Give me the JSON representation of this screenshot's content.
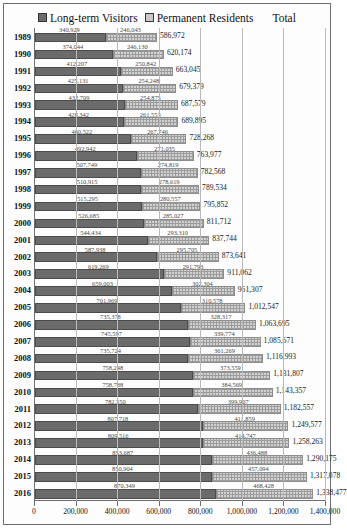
{
  "legend": {
    "series1_label": "Long-term Visitors",
    "series2_label": "Permanent Residents",
    "total_label": "Total",
    "series1_color": "#6b6b6b",
    "series2_color": "#d2d2d2"
  },
  "chart_data": {
    "type": "bar",
    "orientation": "horizontal",
    "stacked": true,
    "title": "",
    "xlabel": "",
    "ylabel": "",
    "xlim": [
      0,
      1400000
    ],
    "xticks": [
      0,
      200000,
      400000,
      600000,
      800000,
      1000000,
      1200000,
      1400000
    ],
    "xtick_labels": [
      "0",
      "200,000",
      "400,000",
      "600,000",
      "800,000",
      "1,000,000",
      "1,200,000",
      "1,400,000"
    ],
    "grid": true,
    "legend_position": "top",
    "categories": [
      "1989",
      "1990",
      "1991",
      "1992",
      "1993",
      "1994",
      "1995",
      "1996",
      "1997",
      "1998",
      "1999",
      "2000",
      "2001",
      "2002",
      "2003",
      "2004",
      "2005",
      "2006",
      "2007",
      "2008",
      "2009",
      "2010",
      "2011",
      "2012",
      "2013",
      "2014",
      "2015",
      "2016"
    ],
    "series": [
      {
        "name": "Long-term Visitors",
        "values": [
          340929,
          374044,
          412207,
          425131,
          432709,
          428342,
          460522,
          492942,
          507749,
          510915,
          515295,
          526685,
          544434,
          587938,
          619269,
          659003,
          701969,
          735378,
          745597,
          735724,
          758248,
          758788,
          782550,
          807718,
          809516,
          853687,
          850904,
          870349
        ],
        "value_labels": [
          "340,929",
          "374,044",
          "412,207",
          "425,131",
          "432,709",
          "428,342",
          "460,522",
          "492,942",
          "507,749",
          "510,915",
          "515,295",
          "526,685",
          "544,434",
          "587,938",
          "619,269",
          "659,003",
          "701,969",
          "735,378",
          "745,597",
          "735,724",
          "758,248",
          "758,788",
          "782,550",
          "807,718",
          "809,516",
          "853,687",
          "850,904",
          "870,349"
        ]
      },
      {
        "name": "Permanent Residents",
        "values": [
          246043,
          246130,
          250842,
          254248,
          254875,
          261553,
          267746,
          271035,
          274819,
          278619,
          280557,
          285027,
          293310,
          295705,
          291793,
          302304,
          310578,
          328317,
          339774,
          361269,
          373559,
          384569,
          399907,
          411859,
          414747,
          436488,
          457094,
          468428
        ],
        "value_labels": [
          "246,043",
          "246,130",
          "250,842",
          "254,248",
          "254,875",
          "261,553",
          "267,746",
          "271,035",
          "274,819",
          "278,619",
          "280,557",
          "285,027",
          "293,310",
          "295,705",
          "291,793",
          "302,304",
          "310,578",
          "328,317",
          "339,774",
          "361,269",
          "373,559",
          "384,569",
          "399,907",
          "411,859",
          "414,747",
          "436,488",
          "457,094",
          "468,428"
        ]
      }
    ],
    "totals": [
      586972,
      620174,
      663045,
      679379,
      687579,
      689895,
      728268,
      763977,
      782568,
      789534,
      795852,
      811712,
      837744,
      873641,
      911062,
      961307,
      1012547,
      1063695,
      1085671,
      1116993,
      1131807,
      1143357,
      1182557,
      1249577,
      1258263,
      1290175,
      1317078,
      1338477
    ],
    "total_labels": [
      "586,972",
      "620,174",
      "663,045",
      "679,379",
      "687,579",
      "689,895",
      "728,268",
      "763,977",
      "782,568",
      "789,534",
      "795,852",
      "811,712",
      "837,744",
      "873,641",
      "911,062",
      "961,307",
      "1,012,547",
      "1,063,695",
      "1,085,671",
      "1,116,993",
      "1,131,807",
      "1,143,357",
      "1,182,557",
      "1,249,577",
      "1,258,263",
      "1,290,175",
      "1,317,078",
      "1,338,477"
    ]
  }
}
